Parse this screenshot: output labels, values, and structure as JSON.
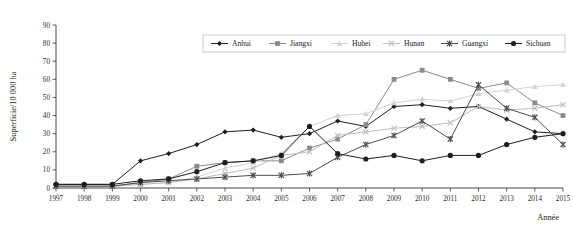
{
  "chart_data": {
    "type": "line",
    "title": "",
    "xlabel": "Année",
    "ylabel": "Superficie/10 000 ha",
    "categories": [
      1997,
      1998,
      1999,
      2000,
      2001,
      2002,
      2003,
      2004,
      2005,
      2006,
      2007,
      2008,
      2009,
      2010,
      2011,
      2012,
      2013,
      2014,
      2015
    ],
    "xlim": [
      1997,
      2015
    ],
    "ylim": [
      0,
      90
    ],
    "yticks": [
      0,
      10,
      20,
      30,
      40,
      50,
      60,
      70,
      80,
      90
    ],
    "xticks": [
      "1997",
      "1998",
      "1999",
      "2000",
      "2001",
      "2002",
      "2003",
      "2004",
      "2005",
      "2006",
      "2007",
      "2008",
      "2009",
      "2010",
      "2011",
      "2012",
      "2013",
      "2014",
      "2015"
    ],
    "grid": false,
    "legend_position": "top-center",
    "series": [
      {
        "name": "Anhui",
        "marker": "diamond",
        "color": "#1f1f1f",
        "values": [
          2,
          2,
          2,
          15,
          19,
          24,
          31,
          32,
          28,
          30,
          37,
          34,
          45,
          46,
          44,
          45,
          38,
          31,
          30
        ]
      },
      {
        "name": "Jiangxi",
        "marker": "square",
        "color": "#8a8a8a",
        "values": [
          1,
          1,
          1,
          3,
          5,
          12,
          14,
          15,
          15,
          22,
          27,
          35,
          60,
          65,
          60,
          55,
          58,
          47,
          40
        ]
      },
      {
        "name": "Hubei",
        "marker": "triangle",
        "color": "#d2d2d2",
        "values": [
          1,
          1,
          1,
          2,
          3,
          6,
          11,
          14,
          19,
          34,
          40,
          41,
          47,
          49,
          48,
          52,
          54,
          56,
          57
        ]
      },
      {
        "name": "Hunan",
        "marker": "x",
        "color": "#bdbdbd",
        "values": [
          1,
          1,
          1,
          2,
          3,
          5,
          8,
          11,
          18,
          20,
          29,
          31,
          33,
          34,
          36,
          45,
          43,
          44,
          46
        ]
      },
      {
        "name": "Guangxi",
        "marker": "asterisk",
        "color": "#4d4d4d",
        "values": [
          1,
          1,
          1,
          3,
          4,
          5,
          6,
          7,
          7,
          8,
          17,
          24,
          29,
          37,
          27,
          57,
          44,
          39,
          24
        ]
      },
      {
        "name": "Sichuan",
        "marker": "circle",
        "color": "#1f1f1f",
        "values": [
          2,
          2,
          2,
          4,
          5,
          9,
          14,
          15,
          18,
          34,
          19,
          16,
          18,
          15,
          18,
          18,
          24,
          28,
          30
        ]
      }
    ]
  },
  "legend": {
    "items": [
      {
        "label": "Anhui"
      },
      {
        "label": "Jiangxi"
      },
      {
        "label": "Hubei"
      },
      {
        "label": "Hunan"
      },
      {
        "label": "Guangxi"
      },
      {
        "label": "Sichuan"
      }
    ]
  }
}
